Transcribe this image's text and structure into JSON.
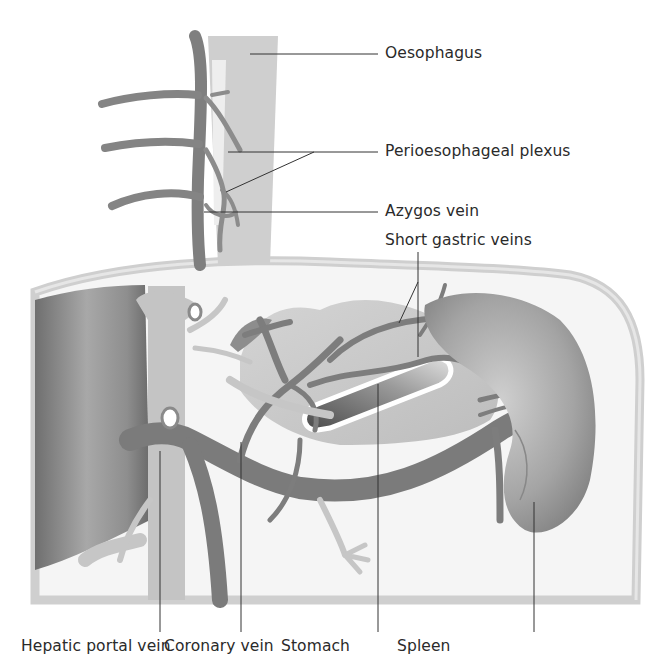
{
  "diagram": {
    "labels_right": [
      {
        "id": "oesophagus",
        "text": "Oesophagus"
      },
      {
        "id": "perioesophageal-plexus",
        "text": "Perioesophageal plexus"
      },
      {
        "id": "azygos-vein",
        "text": "Azygos vein"
      },
      {
        "id": "short-gastric-veins",
        "text": "Short gastric veins"
      }
    ],
    "labels_bottom": [
      {
        "id": "hepatic-portal-vein",
        "text": "Hepatic portal vein"
      },
      {
        "id": "coronary-vein",
        "text": "Coronary vein"
      },
      {
        "id": "stomach",
        "text": "Stomach"
      },
      {
        "id": "spleen",
        "text": "Spleen"
      }
    ],
    "colors": {
      "background": "#ffffff",
      "cavity_fill": "#f4f4f4",
      "cavity_border": "#cfcfcf",
      "oesophagus_fill": "#cdcdcd",
      "vein_dark": "#7d7d7d",
      "vein_light": "#c2c2c2",
      "liver": "#8a8a8a",
      "spleen": "#9a9a9a",
      "leader_line": "#333333"
    }
  }
}
